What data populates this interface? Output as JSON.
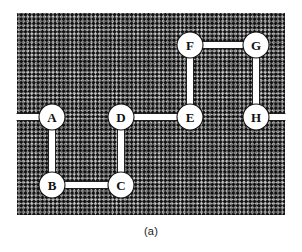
{
  "figure": {
    "caption": "(a)",
    "colors": {
      "hatch_dark": "#141414",
      "hatch_light": "#b8b8b8",
      "background": "#ffffff",
      "node_fill": "#ffffff",
      "node_stroke": "#111111",
      "edge_color": "#ffffff",
      "edge_outline": "#111111",
      "label_color": "#111111"
    },
    "region": {
      "x": 17,
      "y": 13,
      "width": 268,
      "height": 202
    }
  },
  "graph_data": {
    "type": "node-link-diagram",
    "node_radius": 13,
    "edge_width": 7,
    "nodes": [
      {
        "id": "A",
        "label": "A",
        "x": 52,
        "y": 117
      },
      {
        "id": "B",
        "label": "B",
        "x": 52,
        "y": 185
      },
      {
        "id": "C",
        "label": "C",
        "x": 121,
        "y": 185
      },
      {
        "id": "D",
        "label": "D",
        "x": 121,
        "y": 117
      },
      {
        "id": "E",
        "label": "E",
        "x": 190,
        "y": 117
      },
      {
        "id": "F",
        "label": "F",
        "x": 190,
        "y": 45
      },
      {
        "id": "G",
        "label": "G",
        "x": 256,
        "y": 45
      },
      {
        "id": "H",
        "label": "H",
        "x": 256,
        "y": 117
      }
    ],
    "edges": [
      {
        "from": "A",
        "to": "B",
        "orientation": "vertical"
      },
      {
        "from": "B",
        "to": "C",
        "orientation": "horizontal"
      },
      {
        "from": "C",
        "to": "D",
        "orientation": "vertical"
      },
      {
        "from": "D",
        "to": "E",
        "orientation": "horizontal"
      },
      {
        "from": "E",
        "to": "F",
        "orientation": "vertical"
      },
      {
        "from": "F",
        "to": "G",
        "orientation": "horizontal"
      },
      {
        "from": "G",
        "to": "H",
        "orientation": "vertical"
      }
    ],
    "stubs": [
      {
        "from": "A",
        "direction": "left",
        "to_x": 17,
        "to_y": 117
      },
      {
        "from": "H",
        "direction": "right",
        "to_x": 285,
        "to_y": 117
      }
    ]
  }
}
